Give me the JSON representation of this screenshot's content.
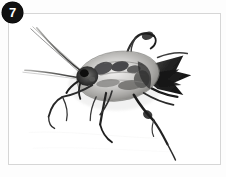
{
  "panel": {
    "badge_label": "7",
    "badge_bg": "#111111",
    "badge_fg": "#ffffff",
    "frame_border_color": "#d6d6d6",
    "frame_bg": "#ffffff",
    "page_bg": "#fdfdfd"
  },
  "photo": {
    "subject": "insect-specimen",
    "description": "Grayscale photograph of a winged insect with two long curving antennae sweeping toward the upper left, a mottled gray oval body, dark spiny wing tips extending to the right, and several thin dark legs, one hind leg trailing toward the lower right.",
    "palette": {
      "body_light": "#d8d8d6",
      "body_mid": "#9a9a98",
      "body_dark": "#4a4a4a",
      "ink_black": "#1c1c1c",
      "background": "#ffffff"
    }
  }
}
